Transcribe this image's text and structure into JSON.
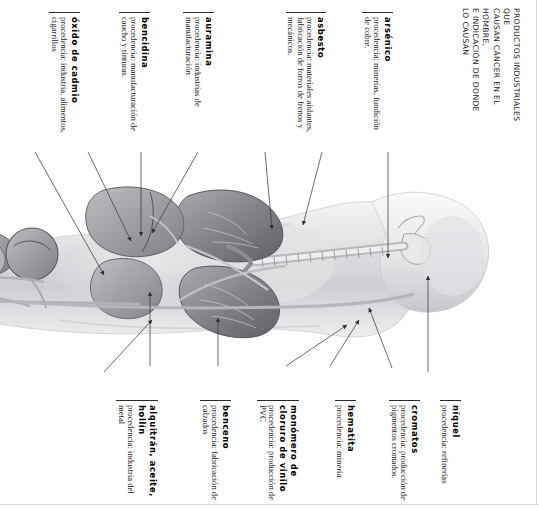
{
  "title": {
    "lines": [
      "PRODUCTOS INDUSTRIALES QUE",
      "CAUSAN CÁNCER EN EL HOMBRE,",
      "E INDICACIÓN DE DONDE",
      "LO CAUSAN"
    ],
    "full": "PRODUCTOS INDUSTRIALES QUE CAUSAN CÁNCER EN EL HOMBRE, E INDICACIÓN DE DONDE LO CAUSAN"
  },
  "colors": {
    "ink": "#111111",
    "rule": "#2a2a2a",
    "leader": "#3a3a3a",
    "figure_light": "#e9e9ea",
    "figure_mid": "#c2c3c6",
    "figure_dark": "#8e9094",
    "organ_dark": "#6f7176",
    "frame": "#d8d8d8"
  },
  "top_labels": [
    {
      "id": "arsenico",
      "title": "arsénico",
      "body": "procedencia: minerías, fundición de cobre."
    },
    {
      "id": "asbesto",
      "title": "asbesto",
      "body": "procedencia: materiales aislantes, fabricación de forros de frenos y mecánicos."
    },
    {
      "id": "auramina",
      "title": "auramina",
      "body": "procedencia: industrias de manufacturación"
    },
    {
      "id": "bencidina",
      "title": "bencidina",
      "body": "procedencia: manufacturación de caucho y tinturas."
    },
    {
      "id": "oxido-de-cadmio",
      "title": "óxido de cadmio",
      "body": "procedencia: industria, alimentos, cigarrillos"
    }
  ],
  "bottom_labels": [
    {
      "id": "niquel",
      "title": "níquel",
      "body": "procedencia: refinerías"
    },
    {
      "id": "cromatos",
      "title": "cromatos",
      "body": "procedencia: producción de pigmentos cromados."
    },
    {
      "id": "hematita",
      "title": "hematita",
      "body": "procedencia: minería"
    },
    {
      "id": "monomero-de-cloruro-de-vinilo",
      "title": "monómero de cloruro de vinilo",
      "body": "procedencia: producción de PVC"
    },
    {
      "id": "benceno",
      "title": "benceno",
      "body": "procedencia: fabricación de calzados"
    },
    {
      "id": "alquitran-aceite-hollin",
      "title": "alquitrán, aceite, hollín",
      "body": "procedencia: industria del metal"
    }
  ],
  "figure": {
    "name": "human-body-anatomical-illustration"
  }
}
